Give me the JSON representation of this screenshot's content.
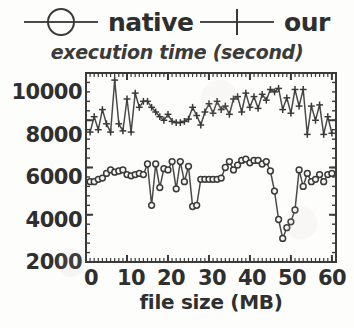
{
  "legend": {
    "native": {
      "label": "native",
      "marker": "circle-marker-icon"
    },
    "our": {
      "label": "our",
      "marker": "plus-marker-icon"
    }
  },
  "axes": {
    "title": "execution time (second)",
    "xlabel": "file size (MB)",
    "yticks": [
      "2000",
      "4000",
      "6000",
      "8000",
      "10000"
    ],
    "xticks": [
      "0",
      "10",
      "20",
      "30",
      "40",
      "50",
      "60"
    ]
  },
  "colors": {
    "ink": "#2f2f2f",
    "series": "#4a4a4a",
    "background": "#fdfdfc",
    "frame": "#3a3a3a"
  },
  "chart_data": {
    "type": "line",
    "title": "execution time (second)",
    "xlabel": "file size (MB)",
    "ylabel": "execution time (second)",
    "xlim": [
      0,
      61
    ],
    "ylim": [
      2000,
      10000
    ],
    "grid": false,
    "legend_position": "above-plot",
    "x": [
      1,
      2,
      3,
      4,
      5,
      6,
      7,
      8,
      9,
      10,
      11,
      12,
      13,
      14,
      15,
      16,
      17,
      18,
      19,
      20,
      21,
      22,
      23,
      24,
      25,
      26,
      27,
      28,
      29,
      30,
      31,
      32,
      33,
      34,
      35,
      36,
      37,
      38,
      39,
      40,
      41,
      42,
      43,
      44,
      45,
      46,
      47,
      48,
      49,
      50,
      51,
      52,
      53,
      54,
      55,
      56,
      57,
      58,
      59,
      60
    ],
    "series": [
      {
        "name": "our",
        "marker": "plus",
        "values": [
          7500,
          8150,
          7600,
          8450,
          7850,
          7500,
          9700,
          7850,
          7550,
          8900,
          7500,
          9150,
          8550,
          8800,
          8800,
          8550,
          8350,
          8150,
          8000,
          8250,
          7950,
          7900,
          7900,
          7950,
          8050,
          8550,
          8200,
          7800,
          8350,
          8700,
          8300,
          8800,
          8450,
          8600,
          8250,
          8900,
          9000,
          8350,
          9150,
          8550,
          9000,
          8500,
          9100,
          8850,
          9300,
          9200,
          9350,
          8450,
          8950,
          8300,
          9300,
          8600,
          9300,
          7400,
          8600,
          8000,
          8650,
          7400,
          8150,
          7450
        ]
      },
      {
        "name": "native",
        "marker": "circle",
        "values": [
          5400,
          5400,
          5500,
          5550,
          5750,
          5900,
          5800,
          5850,
          5900,
          5700,
          5650,
          5700,
          5750,
          5700,
          6150,
          4400,
          6150,
          5150,
          5950,
          5900,
          6250,
          5100,
          6250,
          5400,
          6050,
          4350,
          4400,
          5500,
          5500,
          5500,
          5500,
          5500,
          5550,
          6000,
          6250,
          5900,
          6100,
          6300,
          6350,
          6200,
          6300,
          6300,
          6150,
          6250,
          5850,
          5000,
          3800,
          3000,
          3450,
          3700,
          4200,
          5900,
          5200,
          5750,
          5400,
          5500,
          5700,
          5400,
          5700,
          5750
        ]
      }
    ]
  }
}
